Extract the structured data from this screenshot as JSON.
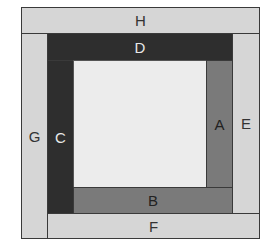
{
  "diagram": {
    "title": "",
    "pieces": [
      {
        "label": "H",
        "color": "#d6d6d6",
        "text_color": "#333333"
      },
      {
        "label": "D",
        "color": "#2e2e2e",
        "text_color": "#e8e8e8"
      },
      {
        "label": "G",
        "color": "#d6d6d6",
        "text_color": "#333333"
      },
      {
        "label": "C",
        "color": "#2e2e2e",
        "text_color": "#e8e8e8"
      },
      {
        "label": "A",
        "color": "#7a7a7a",
        "text_color": "#222222"
      },
      {
        "label": "E",
        "color": "#d6d6d6",
        "text_color": "#333333"
      },
      {
        "label": "B",
        "color": "#7a7a7a",
        "text_color": "#222222"
      },
      {
        "label": "F",
        "color": "#d6d6d6",
        "text_color": "#333333"
      }
    ],
    "center": {
      "label": "",
      "color": "#ececec"
    }
  }
}
